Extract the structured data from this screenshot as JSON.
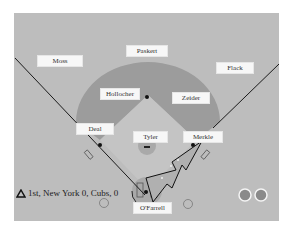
{
  "diagram": {
    "type": "baseball-field-positions",
    "colors": {
      "outfield": "#bdbdbd",
      "infield_arc": "#9c9c9c",
      "infield_dirt": "#c8c8c8",
      "label_bg": "#f7f7f7",
      "foul_line": "#1a1a1a",
      "out_indicator": "#8a8a8a"
    },
    "players": [
      {
        "name": "Moss",
        "position": "left-field"
      },
      {
        "name": "Paskert",
        "position": "center-field"
      },
      {
        "name": "Flack",
        "position": "right-field"
      },
      {
        "name": "Hollocher",
        "position": "shortstop"
      },
      {
        "name": "Zeider",
        "position": "second-base"
      },
      {
        "name": "Deal",
        "position": "third-base"
      },
      {
        "name": "Tyler",
        "position": "pitcher"
      },
      {
        "name": "Merkle",
        "position": "first-base"
      },
      {
        "name": "O'Farrell",
        "position": "catcher"
      }
    ],
    "scoreboard": {
      "inning_icon": "triangle-up-icon",
      "text": "1st, New York 0, Cubs, 0"
    },
    "outs_indicators": 2
  }
}
